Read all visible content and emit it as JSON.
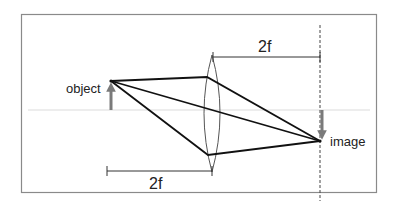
{
  "diagram": {
    "title": "",
    "labels": {
      "object": "object",
      "image": "image",
      "top_distance": "2f",
      "bottom_distance": "2f"
    },
    "colors": {
      "frame": "#8a8a8a",
      "axis": "#d8d8d8",
      "rays": "#111111",
      "arrows": "#7a7a7a",
      "lens": "#555555",
      "dashed_plane": "#444444"
    },
    "geometry": {
      "frame": {
        "x": 21,
        "y": 14,
        "w": 356,
        "h": 179
      },
      "optical_axis_y": 110,
      "object_point": [
        111,
        81
      ],
      "image_point": [
        320,
        141
      ],
      "lens_center_x": 212,
      "lens_top_y": 55,
      "lens_bottom_y": 172,
      "image_plane_x": 320
    }
  }
}
